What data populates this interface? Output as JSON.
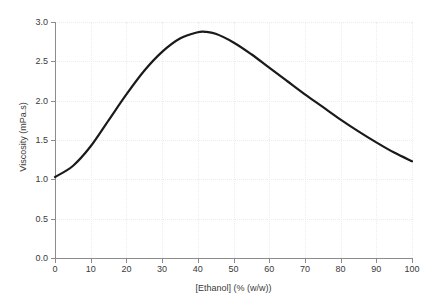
{
  "chart_data": {
    "type": "line",
    "title": "",
    "xlabel": "[Ethanol] (% (w/w))",
    "ylabel": "Viscosity (mPa.s)",
    "xlim": [
      0,
      100
    ],
    "ylim": [
      0.0,
      3.0
    ],
    "grid": true,
    "legend": null,
    "line_color": "#1a1a1a",
    "line_width": 2.2,
    "x_ticks": [
      0,
      10,
      20,
      30,
      40,
      50,
      60,
      70,
      80,
      90,
      100
    ],
    "x_tick_labels": [
      "0",
      "10",
      "20",
      "30",
      "40",
      "50",
      "60",
      "70",
      "80",
      "90",
      "100"
    ],
    "y_ticks": [
      0.0,
      0.5,
      1.0,
      1.5,
      2.0,
      2.5,
      3.0
    ],
    "y_tick_labels": [
      "0.0",
      "0.5",
      "1.0",
      "1.5",
      "2.0",
      "2.5",
      "3.0"
    ],
    "series": [
      {
        "name": "Viscosity of ethanol-water mixture",
        "x": [
          0,
          5,
          10,
          15,
          20,
          25,
          30,
          35,
          40,
          42,
          45,
          50,
          55,
          60,
          65,
          70,
          75,
          80,
          85,
          90,
          95,
          100
        ],
        "y": [
          1.03,
          1.17,
          1.42,
          1.75,
          2.08,
          2.38,
          2.62,
          2.79,
          2.87,
          2.875,
          2.85,
          2.74,
          2.59,
          2.42,
          2.25,
          2.08,
          1.92,
          1.76,
          1.61,
          1.47,
          1.34,
          1.23
        ]
      }
    ],
    "peak": {
      "x": 42,
      "y": 2.87
    },
    "endpoints": {
      "start": {
        "x": 0,
        "y": 1.03
      },
      "end": {
        "x": 100,
        "y": 1.23
      }
    }
  },
  "axes": {
    "spine_color": "#8c8c8c",
    "grid_color": "#ececec",
    "background": "#ffffff"
  }
}
